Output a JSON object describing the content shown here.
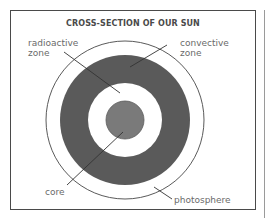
{
  "diagram": {
    "title": "CROSS-SECTION OF OUR SUN",
    "center": {
      "x": 125,
      "y": 120
    },
    "layers": [
      {
        "name": "photosphere",
        "radius": 79,
        "fill": "#ffffff",
        "stroke": "#5a5a5a"
      },
      {
        "name": "convective zone",
        "radius": 65,
        "fill": "#5a5a5a"
      },
      {
        "name": "radioactive zone",
        "radius": 37,
        "fill": "#ffffff"
      },
      {
        "name": "core",
        "radius": 19,
        "fill": "#7a7a7a",
        "stroke": "#5a5a5a"
      }
    ],
    "labels": {
      "radioactive": {
        "line1": "radioactive",
        "line2": "zone"
      },
      "convective": {
        "line1": "convective",
        "line2": "zone"
      },
      "core": "core",
      "photosphere": "photosphere"
    },
    "leader_lines": [
      {
        "target": "radioactive zone",
        "x1": 64,
        "y1": 52,
        "x2": 120,
        "y2": 93
      },
      {
        "target": "convective zone",
        "x1": 167,
        "y1": 45,
        "x2": 130,
        "y2": 67
      },
      {
        "target": "core",
        "x1": 123,
        "y1": 132,
        "x2": 67,
        "y2": 185
      },
      {
        "target": "photosphere",
        "x1": 154,
        "y1": 187,
        "x2": 172,
        "y2": 199
      }
    ],
    "colors": {
      "frame": "#4a4a4a",
      "dark_ring": "#5a5a5a",
      "core": "#7a7a7a",
      "text": "#6a6a6a"
    }
  }
}
